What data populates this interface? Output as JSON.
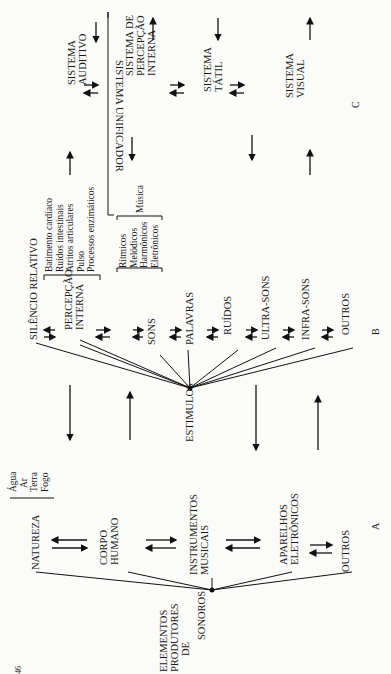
{
  "page_number": "46",
  "sections": {
    "a": "A",
    "b": "B",
    "c": "C"
  },
  "producers": {
    "root": [
      "ELEMENTOS",
      "PRODUTORES",
      "DE",
      "SONOROS"
    ],
    "items": [
      {
        "label": [
          "NATUREZA"
        ],
        "sub": [
          "Água",
          "Ar",
          "Terra",
          "Fogo"
        ]
      },
      {
        "label": [
          "CORPO",
          "HUMANO"
        ]
      },
      {
        "label": [
          "INSTRUMENTOS",
          "MUSICAIS"
        ]
      },
      {
        "label": [
          "APARELHOS",
          "ELETRÔNICOS"
        ]
      },
      {
        "label": [
          "OUTROS"
        ]
      }
    ]
  },
  "stimuli": {
    "root": "ESTIMULOS",
    "items": [
      {
        "label": [
          "SILÊNCIO RELATIVO"
        ]
      },
      {
        "label": [
          "PERCEPÇÃO",
          "INTERNA"
        ],
        "sub": [
          "Batimento cardíaco",
          "Ruídos intestinais",
          "Atritos articulares",
          "Pulso",
          "Processos enzimáticos"
        ]
      },
      {
        "label": [
          "SONS"
        ],
        "sub": [
          "Rítmicos",
          "Melódicos",
          "Harmônicos",
          "Eletrônicos"
        ],
        "group": "Música"
      },
      {
        "label": [
          "PALAVRAS"
        ]
      },
      {
        "label": [
          "RUÍDOS"
        ]
      },
      {
        "label": [
          "ULTRA-SONS"
        ]
      },
      {
        "label": [
          "INFRA-SONS"
        ]
      },
      {
        "label": [
          "OUTROS"
        ]
      }
    ]
  },
  "systems": {
    "unifier": "SISTEMA UNIFICADOR",
    "items": [
      {
        "label": [
          "SISTEMA",
          "AUDITIVO"
        ]
      },
      {
        "label": [
          "SISTEMA DE",
          "PERCEPÇÃO",
          "INTERNA"
        ]
      },
      {
        "label": [
          "SISTEMA",
          "TÁTIL"
        ]
      },
      {
        "label": [
          "SISTEMA",
          "VISUAL"
        ]
      }
    ]
  }
}
